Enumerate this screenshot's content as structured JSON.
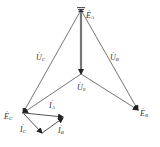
{
  "diagram": {
    "type": "phasor-diagram",
    "colors": {
      "line": "#555555",
      "arrow": "#222222",
      "text": "#333333"
    },
    "points": {
      "EA": [
        81,
        10
      ],
      "N": [
        81,
        74
      ],
      "EB": [
        138,
        110
      ],
      "EC": [
        23,
        113
      ],
      "IA_tip": [
        63,
        117
      ],
      "IC_tip": [
        42,
        133
      ]
    },
    "labels": [
      {
        "id": "EA",
        "base": "E",
        "sub": "A",
        "x": 86,
        "y": 10
      },
      {
        "id": "EB",
        "base": "E",
        "sub": "B",
        "x": 140,
        "y": 108
      },
      {
        "id": "EC",
        "base": "E",
        "sub": "C",
        "x": 4,
        "y": 111
      },
      {
        "id": "UC",
        "base": "U",
        "sub": "C",
        "x": 36,
        "y": 52
      },
      {
        "id": "UB",
        "base": "U",
        "sub": "B",
        "x": 110,
        "y": 52
      },
      {
        "id": "U0",
        "base": "U",
        "sub": "0",
        "x": 78,
        "y": 82
      },
      {
        "id": "IA",
        "base": "I",
        "sub": "A",
        "x": 49,
        "y": 100
      },
      {
        "id": "IC",
        "base": "I",
        "sub": "C",
        "x": 20,
        "y": 124
      },
      {
        "id": "IB",
        "base": "I",
        "sub": "B",
        "x": 58,
        "y": 125
      }
    ]
  }
}
